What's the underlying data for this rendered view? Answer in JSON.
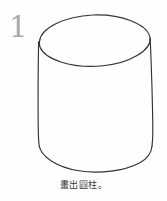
{
  "worksheet": {
    "item_number": "1",
    "caption": "畫出圓柱。",
    "figure": {
      "name": "cylinder",
      "stroke_color": "#333333",
      "number_color": "#a9a9a9",
      "background_color": "#fefefe",
      "style": "hand-drawn line art, unfilled"
    }
  }
}
